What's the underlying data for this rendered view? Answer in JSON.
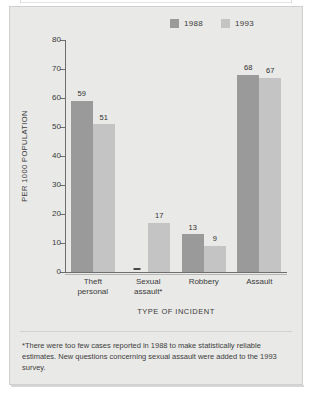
{
  "chart_data": {
    "type": "bar",
    "title": "",
    "xlabel": "TYPE OF INCIDENT",
    "ylabel": "PER 1000 POPULATION",
    "ylim": [
      0,
      80
    ],
    "yticks": [
      0,
      10,
      20,
      30,
      40,
      50,
      60,
      70,
      80
    ],
    "grid": false,
    "legend_position": "top-right",
    "categories": [
      "Theft personal",
      "Sexual assault*",
      "Robbery",
      "Assault"
    ],
    "series": [
      {
        "name": "1988",
        "color": "#9a9a9a",
        "values": [
          59,
          null,
          13,
          68
        ],
        "value_labels": [
          "59",
          "—",
          "13",
          "68"
        ]
      },
      {
        "name": "1993",
        "color": "#c4c4c4",
        "values": [
          51,
          17,
          9,
          67
        ],
        "value_labels": [
          "51",
          "17",
          "9",
          "67"
        ]
      }
    ],
    "annotations": [
      "*There were too few cases reported in 1988 to make statistically reliable estimates. New questions concerning sexual assault were added to the 1993 survey."
    ]
  },
  "legend": {
    "entries": [
      {
        "label": "1988",
        "color": "#9a9a9a"
      },
      {
        "label": "1993",
        "color": "#c4c4c4"
      }
    ]
  },
  "axes": {
    "y_title": "PER 1000 POPULATION",
    "x_title": "TYPE OF INCIDENT",
    "y_ticks": [
      "80",
      "70",
      "60",
      "50",
      "40",
      "30",
      "20",
      "10",
      "0"
    ]
  },
  "categories": [
    {
      "line1": "Theft",
      "line2": "personal"
    },
    {
      "line1": "Sexual",
      "line2": "assault*"
    },
    {
      "line1": "Robbery",
      "line2": ""
    },
    {
      "line1": "Assault",
      "line2": ""
    }
  ],
  "bars": [
    {
      "category": "Theft personal",
      "s1988_label": "59",
      "s1993_label": "51"
    },
    {
      "category": "Sexual assault*",
      "s1988_label": "—",
      "s1993_label": "17"
    },
    {
      "category": "Robbery",
      "s1988_label": "13",
      "s1993_label": "9"
    },
    {
      "category": "Assault",
      "s1988_label": "68",
      "s1993_label": "67"
    }
  ],
  "footnote": {
    "text": "*There were too few cases reported in 1988 to make statistically reliable estimates. New questions concerning sexual assault were added to the 1993 survey."
  },
  "colors": {
    "series_1988": "#9a9a9a",
    "series_1993": "#c4c4c4",
    "panel_background": "#e9e9e7",
    "axis": "#6e6e6e",
    "text": "#3a3a3a"
  }
}
